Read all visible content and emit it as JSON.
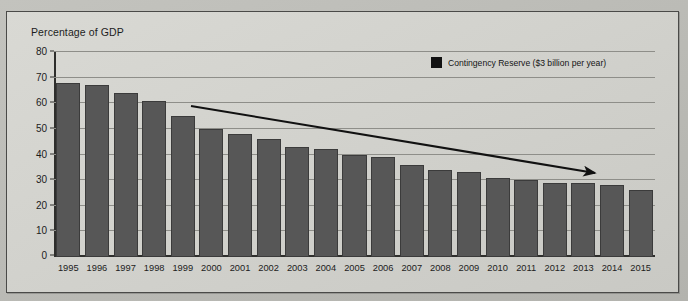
{
  "figure": {
    "y_axis_caption": "Percentage of GDP",
    "legend": {
      "swatch_name": "legend-color-swatch",
      "label": "Contingency Reserve ($3 billion per year)"
    },
    "annotation": {
      "name": "downward-trend-arrow",
      "description": "Downward sloping arrow"
    }
  },
  "chart_data": {
    "type": "bar",
    "title": "",
    "subtitle": "",
    "xlabel": "",
    "ylabel": "Percentage of GDP",
    "ylim": [
      0,
      80
    ],
    "yticks": [
      0,
      10,
      20,
      30,
      40,
      50,
      60,
      70,
      80
    ],
    "ytick_labels": [
      "0",
      "10",
      "20",
      "30",
      "40",
      "50",
      "60",
      "70",
      "80"
    ],
    "grid": true,
    "legend_position": "top-right",
    "bar_color": "#575757",
    "categories": [
      "1995",
      "1996",
      "1997",
      "1998",
      "1999",
      "2000",
      "2001",
      "2002",
      "2003",
      "2004",
      "2005",
      "2006",
      "2007",
      "2008",
      "2009",
      "2010",
      "2011",
      "2012",
      "2013",
      "2014",
      "2015"
    ],
    "series": [
      {
        "name": "Contingency Reserve ($3 billion per year)",
        "values": [
          68,
          67,
          64,
          61,
          55,
          50,
          48,
          46,
          43,
          42,
          40,
          39,
          36,
          34,
          33,
          31,
          30,
          29,
          29,
          28,
          26
        ]
      }
    ],
    "annotations": [
      {
        "type": "arrow",
        "text": "",
        "from": [
          "1999",
          62
        ],
        "to": [
          "2015",
          36
        ]
      }
    ]
  }
}
